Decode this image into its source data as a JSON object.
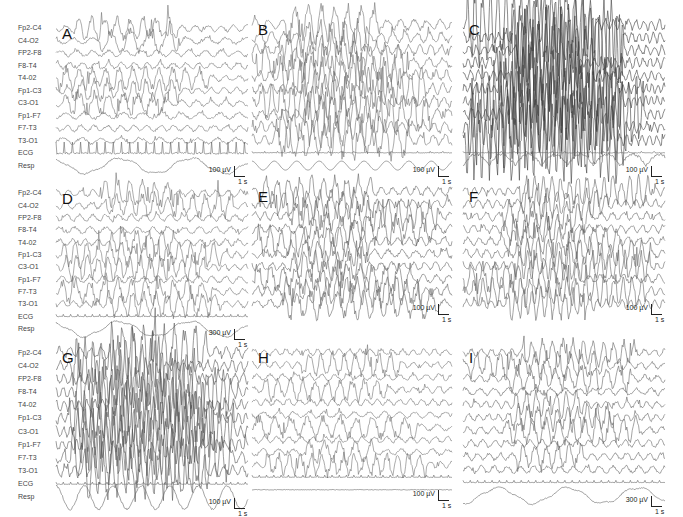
{
  "figure": {
    "channel_labels": [
      "Fp2-C4",
      "C4-O2",
      "FP2-F8",
      "F8-T4",
      "T4-02",
      "Fp1-C3",
      "C3-O1",
      "Fp1-F7",
      "F7-T3",
      "T3-O1",
      "ECG",
      "Resp"
    ]
  },
  "chart_data": {
    "type": "line",
    "title": "",
    "xlabel": "time",
    "ylabel": "amplitude (µV)",
    "grid": false,
    "legend_position": "none",
    "channels": [
      "Fp2-C4",
      "C4-O2",
      "FP2-F8",
      "F8-T4",
      "T4-02",
      "Fp1-C3",
      "C3-O1",
      "Fp1-F7",
      "F7-T3",
      "T3-O1",
      "ECG",
      "Resp"
    ],
    "panels": [
      {
        "id": "A",
        "amp_scale": "100 µV",
        "time_scale": "1 s",
        "activity": "rhythmic spikes/sharp waves in Fp2-C4, C4-O2, Fp1-C3, C3-O1; ECG prominent"
      },
      {
        "id": "B",
        "amp_scale": "100 µV",
        "time_scale": "1 s",
        "activity": "diffuse high-amplitude rhythmic activity; regular Resp sine wave"
      },
      {
        "id": "C",
        "amp_scale": "100 µV",
        "time_scale": "1 s",
        "activity": "very high amplitude dense generalized discharges"
      },
      {
        "id": "D",
        "amp_scale": "300 µV",
        "time_scale": "1 s",
        "activity": "rhythmic bursts in Fp2-C4, C4-O2, Fp1-C3, C3-O1, F7-T3"
      },
      {
        "id": "E",
        "amp_scale": "100 µV",
        "time_scale": "1 s",
        "activity": "central burst of rhythmic activity across channels"
      },
      {
        "id": "F",
        "amp_scale": "100 µV",
        "time_scale": "1 s",
        "activity": "mixed polyspike activity, irregular"
      },
      {
        "id": "G",
        "amp_scale": "100 µV",
        "time_scale": "1 s",
        "activity": "high-amplitude generalized discharges; large Resp oscillations"
      },
      {
        "id": "H",
        "amp_scale": "100 µV",
        "time_scale": "1 s",
        "activity": "intermittent rhythmic bursts; flat Resp"
      },
      {
        "id": "I",
        "amp_scale": "300 µV",
        "time_scale": "1 s",
        "activity": "periodic spikes across channels; slow Resp waves"
      }
    ]
  },
  "panels": [
    {
      "id": "A",
      "letter": "A",
      "amp": "100 µV",
      "time": "1 s",
      "x": 56,
      "y": 22,
      "w": 192,
      "h": 150,
      "labels": true,
      "density": 1.0,
      "bursts": [
        0,
        1,
        4,
        5,
        6
      ],
      "ecg": "spiky",
      "resp": "slow",
      "gain": 1.0,
      "dark": 0.55
    },
    {
      "id": "B",
      "letter": "B",
      "amp": "100 µV",
      "time": "1 s",
      "x": 252,
      "y": 18,
      "w": 200,
      "h": 154,
      "labels": false,
      "density": 1.25,
      "bursts": [
        0,
        1,
        2,
        3,
        4,
        5,
        6,
        7,
        8,
        9
      ],
      "ecg": "flat",
      "resp": "sine",
      "gain": 1.6,
      "dark": 0.55
    },
    {
      "id": "C",
      "letter": "C",
      "amp": "100 µV",
      "time": "1 s",
      "x": 463,
      "y": 18,
      "w": 202,
      "h": 154,
      "labels": false,
      "density": 2.2,
      "bursts": [
        0,
        1,
        2,
        3,
        4,
        5,
        6,
        7,
        8,
        9
      ],
      "ecg": "flat",
      "resp": "spiky",
      "gain": 3.2,
      "dark": 0.75
    },
    {
      "id": "D",
      "letter": "D",
      "amp": "300 µV",
      "time": "1 s",
      "x": 56,
      "y": 187,
      "w": 192,
      "h": 148,
      "labels": true,
      "density": 1.2,
      "bursts": [
        0,
        1,
        4,
        5,
        6,
        8,
        9
      ],
      "ecg": "ticks",
      "resp": "slow",
      "gain": 1.1,
      "dark": 0.55
    },
    {
      "id": "E",
      "letter": "E",
      "amp": "100 µV",
      "time": "1 s",
      "x": 252,
      "y": 185,
      "w": 200,
      "h": 125,
      "labels": false,
      "density": 1.4,
      "bursts": [
        0,
        1,
        2,
        3,
        4,
        5,
        6,
        7,
        8,
        9
      ],
      "ecg": "none",
      "resp": "none",
      "gain": 1.3,
      "dark": 0.6
    },
    {
      "id": "F",
      "letter": "F",
      "amp": "100 µV",
      "time": "1 s",
      "x": 463,
      "y": 185,
      "w": 202,
      "h": 125,
      "labels": false,
      "density": 1.6,
      "bursts": [
        0,
        1,
        2,
        3,
        4,
        5,
        6,
        7,
        8,
        9
      ],
      "ecg": "none",
      "resp": "none",
      "gain": 1.3,
      "dark": 0.6
    },
    {
      "id": "G",
      "letter": "G",
      "amp": "100 µV",
      "time": "1 s",
      "x": 56,
      "y": 346,
      "w": 192,
      "h": 158,
      "labels": true,
      "density": 1.8,
      "bursts": [
        0,
        1,
        2,
        3,
        4,
        5,
        6,
        7,
        8,
        9
      ],
      "ecg": "ticks",
      "resp": "big",
      "gain": 2.2,
      "dark": 0.65
    },
    {
      "id": "H",
      "letter": "H",
      "amp": "100 µV",
      "time": "1 s",
      "x": 252,
      "y": 346,
      "w": 200,
      "h": 150,
      "labels": false,
      "density": 1.2,
      "bursts": [
        1,
        3,
        6,
        8,
        9
      ],
      "ecg": "ticks",
      "resp": "flat",
      "gain": 1.0,
      "dark": 0.55
    },
    {
      "id": "I",
      "letter": "I",
      "amp": "300 µV",
      "time": "1 s",
      "x": 463,
      "y": 346,
      "w": 202,
      "h": 156,
      "labels": false,
      "density": 1.3,
      "bursts": [
        0,
        1,
        2,
        4,
        5,
        6,
        8
      ],
      "ecg": "ticks",
      "resp": "slow",
      "gain": 1.1,
      "dark": 0.6
    }
  ]
}
